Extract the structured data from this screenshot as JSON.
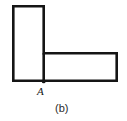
{
  "figure": {
    "caption": "(b)",
    "caption_position": {
      "x": 55,
      "y": 103
    },
    "background_color": "#ffffff",
    "stroke_color": "#151515",
    "stroke_width": 2.6,
    "shape_type": "L-shaped-composite-rectangle",
    "labels": [
      {
        "text": "A",
        "style": "italic",
        "meaning": "corner-point-A",
        "x": 37,
        "y": 86
      }
    ],
    "rectangles": [
      {
        "name": "vertical-rectangle",
        "x": 12,
        "y": 5,
        "width": 33,
        "height": 77
      },
      {
        "name": "horizontal-rectangle",
        "x": 44,
        "y": 52,
        "width": 74,
        "height": 30
      }
    ],
    "outline_path": "M 13.3 6.3 L 43.7 6.3 L 43.7 53.3 L 116.7 53.3 L 116.7 80.7 L 43.7 80.7 L 13.3 80.7 Z",
    "divider_line": {
      "x1": 43.7,
      "y1": 53.3,
      "x2": 43.7,
      "y2": 80.7
    },
    "point_marker": {
      "cx": 43.7,
      "cy": 81.4,
      "r": 1.9
    }
  }
}
